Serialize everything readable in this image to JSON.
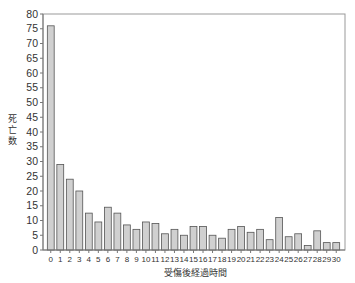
{
  "chart_data": {
    "type": "bar",
    "title": "",
    "xlabel": "受傷後経過時間",
    "ylabel": "死亡数",
    "ylim": [
      0,
      80
    ],
    "yticks": [
      0,
      5,
      10,
      15,
      20,
      25,
      30,
      35,
      40,
      45,
      50,
      55,
      60,
      65,
      70,
      75,
      80
    ],
    "categories": [
      "0",
      "1",
      "2",
      "3",
      "4",
      "5",
      "6",
      "7",
      "8",
      "9",
      "10",
      "11",
      "12",
      "13",
      "14",
      "15",
      "16",
      "17",
      "18",
      "19",
      "20",
      "21",
      "22",
      "23",
      "24",
      "25",
      "26",
      "27",
      "28",
      "29",
      "30"
    ],
    "values": [
      76,
      29,
      24,
      20,
      12.5,
      9.5,
      14.5,
      12.5,
      8.5,
      7,
      9.5,
      9,
      5.5,
      7,
      5,
      8,
      8,
      5,
      4,
      7,
      8,
      6,
      7,
      3.5,
      11,
      4.5,
      5.5,
      1.5,
      6.5,
      2.5,
      2.5
    ],
    "grid": false,
    "legend": null,
    "colors": {
      "bar_fill": "#d0d0d0",
      "bar_stroke": "#555555",
      "axis": "#777777"
    }
  }
}
